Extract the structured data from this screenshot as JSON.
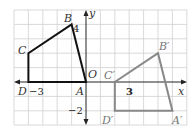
{
  "figure": {
    "type": "coordinate-plane-translation",
    "grid": {
      "x_min": -5,
      "x_max": 7,
      "y_min": -3,
      "y_max": 5,
      "grid_color": "#c8c8c8"
    },
    "axes": {
      "x_label": "x",
      "y_label": "y"
    },
    "tick_labels": {
      "x_neg3": "−3",
      "y_4": "4",
      "y_neg2": "−2",
      "x_3": "3",
      "origin": "O"
    },
    "preimage": {
      "color": "#111111",
      "vertices": [
        {
          "name": "A",
          "x": 0,
          "y": 0
        },
        {
          "name": "B",
          "x": -1,
          "y": 4
        },
        {
          "name": "C",
          "x": -4,
          "y": 2
        },
        {
          "name": "D",
          "x": -4,
          "y": 0
        }
      ]
    },
    "image": {
      "color": "#8a8a8a",
      "vertices": [
        {
          "name": "A′",
          "x": 6,
          "y": -2
        },
        {
          "name": "B′",
          "x": 5,
          "y": 2
        },
        {
          "name": "C′",
          "x": 2,
          "y": 0
        },
        {
          "name": "D′",
          "x": 2,
          "y": -2
        }
      ]
    }
  }
}
